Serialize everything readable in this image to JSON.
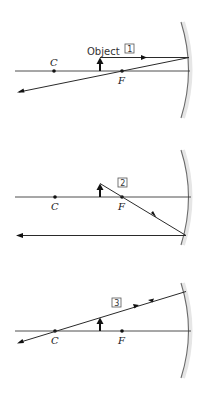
{
  "diagram": {
    "type": "concave-mirror-ray-diagrams",
    "labels": {
      "center_of_curvature": "C",
      "focal_point": "F",
      "object": "Object"
    },
    "panels": [
      {
        "number": "1",
        "ray": "parallel to axis, reflects through F"
      },
      {
        "number": "2",
        "ray": "through F, reflects parallel to axis"
      },
      {
        "number": "3",
        "ray": "through C, reflects back on itself"
      }
    ],
    "colors": {
      "ray": "#2a2a2a",
      "mirror": "#6b6b6b",
      "background": "#ffffff"
    }
  }
}
